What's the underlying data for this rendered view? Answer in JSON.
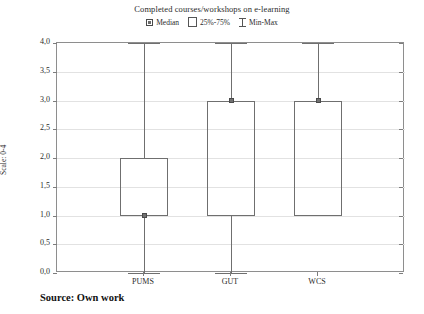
{
  "chart_data": {
    "type": "box",
    "title": "Completed courses/workshops on e-learning",
    "xlabel": "",
    "ylabel": "Scale: 0-4",
    "ylim": [
      0.0,
      4.0
    ],
    "ytick_labels": [
      "4,0",
      "3,5",
      "3,0",
      "2,5",
      "2,0",
      "1,5",
      "1,0",
      "0,5",
      "0,0"
    ],
    "ytick_values": [
      4.0,
      3.5,
      3.0,
      2.5,
      2.0,
      1.5,
      1.0,
      0.5,
      0.0
    ],
    "grid": true,
    "legend_position": "top-center",
    "legend": [
      {
        "label": "Median",
        "symbol": "small-square-marker"
      },
      {
        "label": "25%-75%",
        "symbol": "open-rectangle"
      },
      {
        "label": "Min-Max",
        "symbol": "i-beam-whisker"
      }
    ],
    "categories": [
      "PUMS",
      "GUT",
      "WCS"
    ],
    "boxes": [
      {
        "category": "PUMS",
        "min": 0.0,
        "q1": 1.0,
        "median": 1.0,
        "q3": 2.0,
        "max": 4.0
      },
      {
        "category": "GUT",
        "min": 0.0,
        "q1": 1.0,
        "median": 3.0,
        "q3": 3.0,
        "max": 4.0
      },
      {
        "category": "WCS",
        "min": 1.0,
        "q1": 1.0,
        "median": 3.0,
        "q3": 3.0,
        "max": 4.0
      }
    ]
  },
  "caption": {
    "source_text": "Source: Own work"
  },
  "colors": {
    "frame": "#8e8e8e",
    "grid": "#e2e2e2",
    "box_line": "#6f6f6f",
    "median_marker": "#707070",
    "text": "#2b2b2b",
    "background": "#ffffff"
  }
}
